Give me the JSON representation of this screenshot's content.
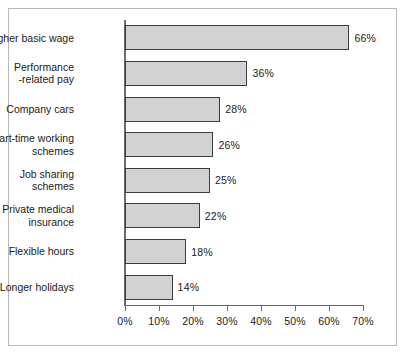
{
  "chart_data": {
    "type": "bar",
    "orientation": "horizontal",
    "title": "",
    "subtitle": "",
    "xlabel": "",
    "ylabel": "",
    "xlim": [
      0,
      70
    ],
    "xtick_labels": [
      "0%",
      "10%",
      "20%",
      "30%",
      "40%",
      "50%",
      "60%",
      "70%"
    ],
    "xtick_values": [
      0,
      10,
      20,
      30,
      40,
      50,
      60,
      70
    ],
    "grid": false,
    "legend": null,
    "categories": [
      "Higher basic wage",
      "Performance\n-related pay",
      "Company cars",
      "Part-time working\nschemes",
      "Job sharing\nschemes",
      "Private medical\ninsurance",
      "Flexible hours",
      "Longer holidays"
    ],
    "values": [
      66,
      36,
      28,
      26,
      25,
      22,
      18,
      14
    ],
    "value_labels": [
      "66%",
      "36%",
      "28%",
      "26%",
      "25%",
      "22%",
      "18%",
      "14%"
    ],
    "colors": {
      "bar_fill": "#d2d2d2",
      "bar_border": "#3c3c3c",
      "axis": "#6b6b6b",
      "text": "#1a1a1a",
      "frame": "#b9b9b9",
      "background": "#ffffff"
    }
  }
}
